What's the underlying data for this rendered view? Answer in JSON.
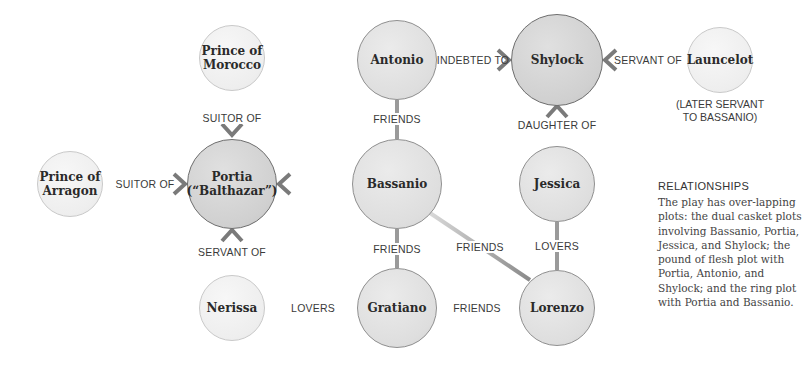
{
  "nodes": {
    "prince_morocco": {
      "label": "Prince of\nMorocco"
    },
    "antonio": {
      "label": "Antonio"
    },
    "shylock": {
      "label": "Shylock"
    },
    "launcelot": {
      "label": "Launcelot",
      "note": "(LATER SERVANT\nTO BASSANIO)"
    },
    "prince_arragon": {
      "label": "Prince of\nArragon"
    },
    "portia": {
      "label": "Portia\n(“Balthazar”)"
    },
    "bassanio": {
      "label": "Bassanio"
    },
    "jessica": {
      "label": "Jessica"
    },
    "nerissa": {
      "label": "Nerissa"
    },
    "gratiano": {
      "label": "Gratiano"
    },
    "lorenzo": {
      "label": "Lorenzo"
    }
  },
  "edges": {
    "morocco_portia": {
      "label": "SUITOR OF"
    },
    "antonio_shylock": {
      "label": "INDEBTED TO"
    },
    "launcelot_shylock": {
      "label": "SERVANT OF"
    },
    "antonio_bassanio": {
      "label": "FRIENDS"
    },
    "jessica_shylock": {
      "label": "DAUGHTER OF"
    },
    "arragon_portia": {
      "label": "SUITOR OF"
    },
    "nerissa_portia": {
      "label": "SERVANT OF"
    },
    "bassanio_gratiano": {
      "label": "FRIENDS"
    },
    "bassanio_lorenzo": {
      "label": "FRIENDS"
    },
    "jessica_lorenzo": {
      "label": "LOVERS"
    },
    "nerissa_gratiano": {
      "label": "LOVERS"
    },
    "gratiano_lorenzo": {
      "label": "FRIENDS"
    }
  },
  "sidebar": {
    "title": "RELATIONSHIPS",
    "body": "The play has over-lapping plots: the dual casket plots involving Bassanio, Portia, Jessica, and Shylock; the pound of flesh plot with Portia, Antonio, and Shylock; and the ring plot with Portia and Bassanio."
  }
}
